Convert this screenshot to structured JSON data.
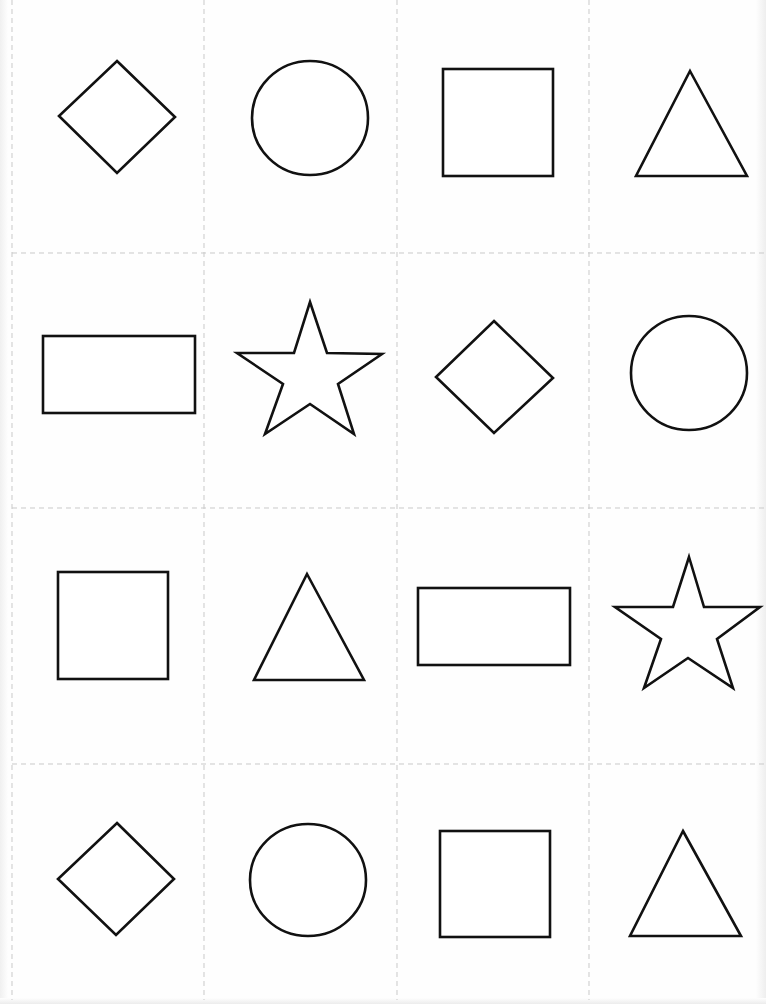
{
  "worksheet": {
    "title": "Shape cards",
    "grid": {
      "rows": 4,
      "columns": 4
    },
    "colors": {
      "outline": "#111111",
      "cut_line": "#c9c9c9",
      "paper": "#fefefe"
    },
    "cards": [
      {
        "row": 1,
        "col": 1,
        "shape": "diamond"
      },
      {
        "row": 1,
        "col": 2,
        "shape": "circle"
      },
      {
        "row": 1,
        "col": 3,
        "shape": "square"
      },
      {
        "row": 1,
        "col": 4,
        "shape": "triangle"
      },
      {
        "row": 2,
        "col": 1,
        "shape": "rectangle"
      },
      {
        "row": 2,
        "col": 2,
        "shape": "star"
      },
      {
        "row": 2,
        "col": 3,
        "shape": "diamond"
      },
      {
        "row": 2,
        "col": 4,
        "shape": "circle"
      },
      {
        "row": 3,
        "col": 1,
        "shape": "square"
      },
      {
        "row": 3,
        "col": 2,
        "shape": "triangle"
      },
      {
        "row": 3,
        "col": 3,
        "shape": "rectangle"
      },
      {
        "row": 3,
        "col": 4,
        "shape": "star"
      },
      {
        "row": 4,
        "col": 1,
        "shape": "diamond"
      },
      {
        "row": 4,
        "col": 2,
        "shape": "circle"
      },
      {
        "row": 4,
        "col": 3,
        "shape": "square"
      },
      {
        "row": 4,
        "col": 4,
        "shape": "triangle"
      }
    ]
  }
}
